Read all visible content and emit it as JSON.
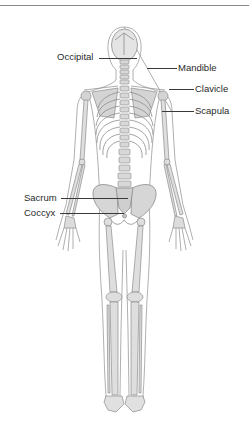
{
  "diagram": {
    "view": "posterior",
    "colors": {
      "bone_fill": "#dcdcdc",
      "bone_stroke": "#8c8c8c",
      "body_outline": "#9a9a9a",
      "label_text": "#2a2a2a",
      "leader_line": "#3a3a3a",
      "rule": "#8a8a8a"
    },
    "labels": [
      {
        "id": "occipital",
        "text": "Occipital",
        "side": "left"
      },
      {
        "id": "mandible",
        "text": "Mandible",
        "side": "right"
      },
      {
        "id": "clavicle",
        "text": "Clavicle",
        "side": "right"
      },
      {
        "id": "scapula",
        "text": "Scapula",
        "side": "right"
      },
      {
        "id": "sacrum",
        "text": "Sacrum",
        "side": "left"
      },
      {
        "id": "coccyx",
        "text": "Coccyx",
        "side": "left"
      }
    ]
  }
}
